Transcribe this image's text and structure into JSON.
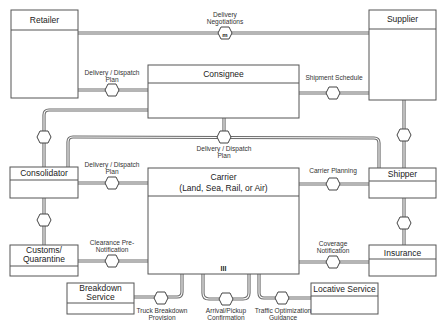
{
  "diagram": {
    "entities": {
      "retailer": "Retailer",
      "supplier": "Supplier",
      "consignee": "Consignee",
      "consolidator": "Consolidator",
      "shipper": "Shipper",
      "carrier_line1": "Carrier",
      "carrier_line2": "(Land, Sea, Rail, or Air)",
      "customs_line1": "Customs/",
      "customs_line2": "Quarantine",
      "insurance": "Insurance",
      "breakdown_line1": "Breakdown",
      "breakdown_line2": "Service",
      "locative": "Locative Service"
    },
    "relations": {
      "retailer_supplier_1": "Delivery",
      "retailer_supplier_2": "Negotiations",
      "retailer_consignee_1": "Delivery / Dispatch",
      "retailer_consignee_2": "Plan",
      "consignee_supplier": "Shipment Schedule",
      "consignee_plan_1": "Delivery / Dispatch",
      "consignee_plan_2": "Plan",
      "consolidator_carrier_1": "Delivery / Dispatch",
      "consolidator_carrier_2": "Plan",
      "carrier_shipper": "Carrier Planning",
      "customs_carrier_1": "Clearance Pre-",
      "customs_carrier_2": "Notification",
      "carrier_insurance_1": "Coverage",
      "carrier_insurance_2": "Notification",
      "breakdown_1": "Truck Breakdown",
      "breakdown_2": "Provision",
      "arrival_1": "Arrival/Pickup",
      "arrival_2": "Confirmation",
      "traffic_1": "Traffic Optimization",
      "traffic_2": "Guidance"
    },
    "marks": {
      "negotiation_mark": "m",
      "carrier_mark": "III"
    },
    "colors": {
      "line": "#6a6a6a",
      "box_border": "#555555",
      "background": "#ffffff"
    }
  }
}
